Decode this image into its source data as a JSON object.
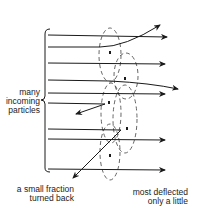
{
  "diagram": {
    "labels": {
      "incoming": [
        "many",
        "incoming",
        "particles"
      ],
      "turned_back": [
        "a small fraction",
        "turned back"
      ],
      "deflected": [
        "most deflected",
        "only a little"
      ]
    },
    "colors": {
      "line": "#1a1a1a",
      "dashed": "#555555",
      "background": "#ffffff"
    },
    "elements": {
      "particle_paths": 9,
      "atoms_dashed_ellipses": 5,
      "nuclei_dots": 5
    }
  }
}
